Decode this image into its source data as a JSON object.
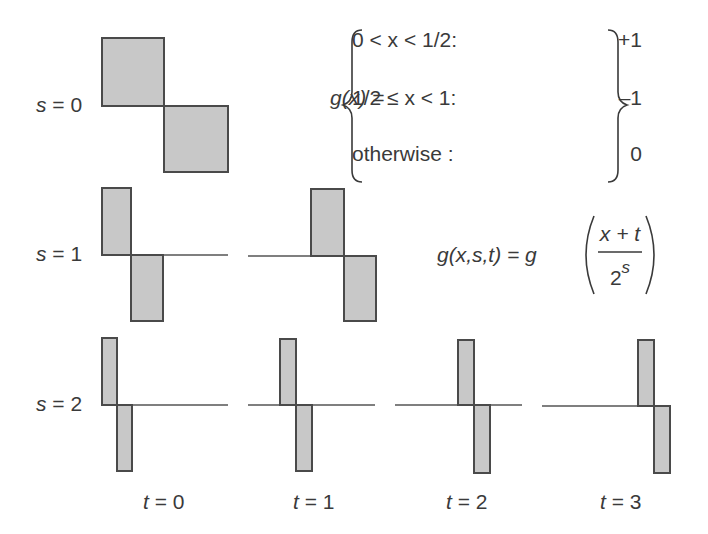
{
  "colors": {
    "fill": "#c8c8c8",
    "stroke": "#4a4a4a",
    "baseline": "#555555",
    "text": "#3a3a3a"
  },
  "definition": {
    "lhs": "g(x) =",
    "cases": [
      {
        "condition": "0 < x < 1/2:",
        "value": "+1"
      },
      {
        "condition": "1/2 ≤ x < 1:",
        "value": "–1"
      },
      {
        "condition": "otherwise :",
        "value": "0"
      }
    ]
  },
  "scaled_formula": {
    "lhs": "g(x,s,t) = g",
    "numerator": "x + t",
    "denominator_base": "2",
    "denominator_exp": "s"
  },
  "row_labels": [
    "s = 0",
    "s = 1",
    "s = 2"
  ],
  "column_labels": [
    "t = 0",
    "t = 1",
    "t = 2",
    "t = 3"
  ],
  "panels": [
    {
      "s": 0,
      "t": 0,
      "baseline_y": 106,
      "line": null,
      "pos": [
        102,
        38,
        164,
        106
      ],
      "neg": [
        164,
        106,
        228,
        172
      ]
    },
    {
      "s": 1,
      "t": 0,
      "baseline_y": 255,
      "line": [
        102,
        228
      ],
      "pos": [
        102,
        188,
        131,
        255
      ],
      "neg": [
        131,
        255,
        163,
        321
      ]
    },
    {
      "s": 1,
      "t": 1,
      "baseline_y": 256,
      "line": [
        248,
        376
      ],
      "pos": [
        311,
        189,
        344,
        256
      ],
      "neg": [
        344,
        256,
        376,
        321
      ]
    },
    {
      "s": 2,
      "t": 0,
      "baseline_y": 405,
      "line": [
        102,
        228
      ],
      "pos": [
        102,
        338,
        117,
        405
      ],
      "neg": [
        117,
        405,
        132,
        471
      ]
    },
    {
      "s": 2,
      "t": 1,
      "baseline_y": 405,
      "line": [
        248,
        375
      ],
      "pos": [
        280,
        339,
        296,
        405
      ],
      "neg": [
        296,
        405,
        312,
        471
      ]
    },
    {
      "s": 2,
      "t": 2,
      "baseline_y": 405,
      "line": [
        395,
        522
      ],
      "pos": [
        458,
        340,
        474,
        405
      ],
      "neg": [
        474,
        405,
        490,
        473
      ]
    },
    {
      "s": 2,
      "t": 3,
      "baseline_y": 406,
      "line": [
        542,
        670
      ],
      "pos": [
        638,
        340,
        654,
        406
      ],
      "neg": [
        654,
        406,
        670,
        473
      ]
    }
  ]
}
